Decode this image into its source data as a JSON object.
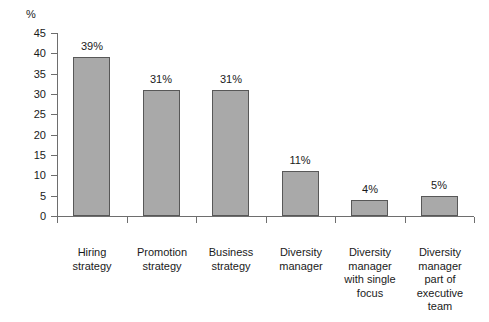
{
  "chart_data": {
    "type": "bar",
    "title": "",
    "subtitle": "",
    "xlabel": "",
    "ylabel": "%",
    "ylim": [
      0,
      45
    ],
    "ytick_step": 5,
    "grid": false,
    "legend": null,
    "categories": [
      "Hiring\nstrategy",
      "Promotion\nstrategy",
      "Business\nstrategy",
      "Diversity\nmanager",
      "Diversity\nmanager\nwith single\nfocus",
      "Diversity\nmanager\npart of\nexecutive\nteam"
    ],
    "values": [
      39,
      31,
      31,
      11,
      4,
      5
    ],
    "data_labels": [
      "39%",
      "31%",
      "31%",
      "11%",
      "4%",
      "5%"
    ],
    "ytick_labels": [
      "45",
      "40",
      "35",
      "30",
      "25",
      "20",
      "15",
      "10",
      "5",
      "0"
    ],
    "colors": {
      "bar_fill": "#a9a9a9",
      "bar_stroke": "#585858",
      "axis": "#6e6e6e",
      "text": "#1a1a1a",
      "background": "#ffffff"
    }
  }
}
